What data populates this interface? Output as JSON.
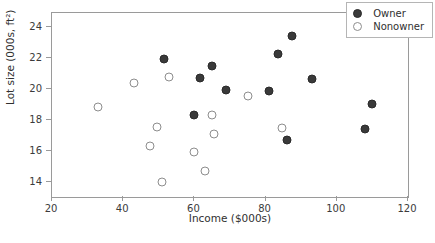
{
  "chart_data": {
    "type": "scatter",
    "title": "",
    "xlabel": "Income ($000s)",
    "ylabel": "Lot size (000s, ft²)",
    "xlim": [
      20,
      120
    ],
    "ylim": [
      13.0,
      24.9
    ],
    "xticks": [
      20,
      40,
      60,
      80,
      100,
      120
    ],
    "yticks": [
      14,
      16,
      18,
      20,
      22,
      24
    ],
    "xticklabels": [
      "20",
      "40",
      "60",
      "80",
      "100",
      "120"
    ],
    "yticklabels": [
      "14",
      "16",
      "18",
      "20",
      "22",
      "24"
    ],
    "grid": false,
    "legend_position": "upper right",
    "series": [
      {
        "name": "Owner",
        "marker": "filled-circle",
        "color": "#3a3a3a",
        "points": [
          [
            51.5,
            21.9
          ],
          [
            60.0,
            18.3
          ],
          [
            61.5,
            20.7
          ],
          [
            65.0,
            21.5
          ],
          [
            69.0,
            19.9
          ],
          [
            81.0,
            19.85
          ],
          [
            83.5,
            22.25
          ],
          [
            87.5,
            23.4
          ],
          [
            86.0,
            16.7
          ],
          [
            93.0,
            20.65
          ],
          [
            108.0,
            17.4
          ],
          [
            110.0,
            19.0
          ]
        ]
      },
      {
        "name": "Nonowner",
        "marker": "open-circle",
        "color": "#8d8d8d",
        "points": [
          [
            33.0,
            18.8
          ],
          [
            43.0,
            20.35
          ],
          [
            47.5,
            16.3
          ],
          [
            49.5,
            17.5
          ],
          [
            51.0,
            13.95
          ],
          [
            53.0,
            20.75
          ],
          [
            60.0,
            15.9
          ],
          [
            63.0,
            14.7
          ],
          [
            65.0,
            18.3
          ],
          [
            65.5,
            17.1
          ],
          [
            75.0,
            19.5
          ],
          [
            84.5,
            17.45
          ]
        ]
      }
    ]
  },
  "legend": {
    "entries": [
      {
        "label": "Owner",
        "marker": "filled-circle"
      },
      {
        "label": "Nonowner",
        "marker": "open-circle"
      }
    ]
  }
}
